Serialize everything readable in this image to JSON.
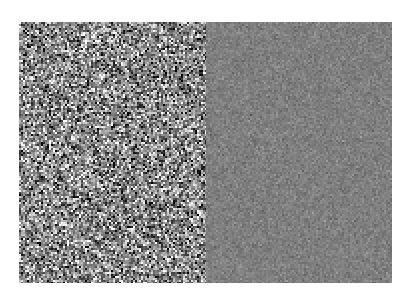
{
  "figure": {
    "background_color": "#ffffff",
    "panels": [
      {
        "id": "left",
        "description": "high-variance gaussian noise",
        "x": 19,
        "y": 22,
        "width": 187,
        "height": 261,
        "mean_gray": 136,
        "std_gray": 62,
        "grain_px": 2
      },
      {
        "id": "right",
        "description": "low-variance gaussian noise",
        "x": 206,
        "y": 22,
        "width": 186,
        "height": 261,
        "mean_gray": 127,
        "std_gray": 10,
        "grain_px": 2
      }
    ]
  }
}
